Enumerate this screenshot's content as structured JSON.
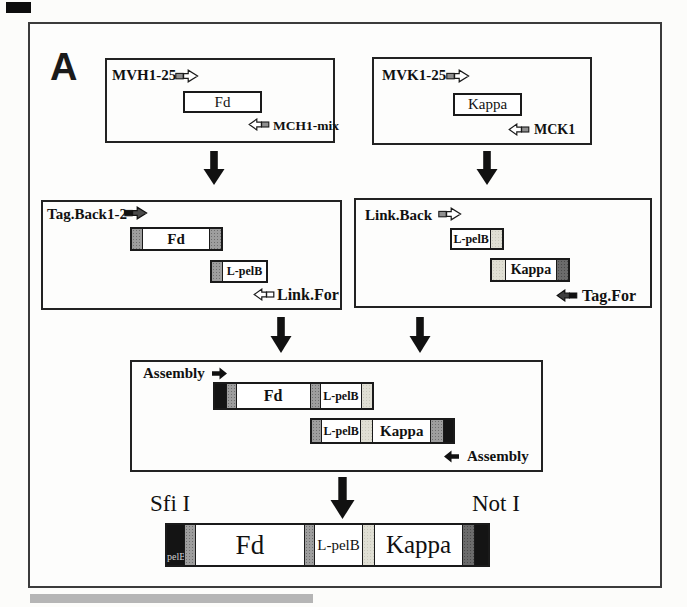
{
  "panel": {
    "label": "A"
  },
  "colors": {
    "cap_gray": "#9e9e9e",
    "cap_light": "#e0dfd4",
    "cap_dark": "#6b6b6b",
    "cap_black": "#141414",
    "arrow_black": "#111111",
    "frame_border": "#3b3b3b"
  },
  "step1_left": {
    "forward_primer": "MVH1-25",
    "gene": "Fd",
    "reverse_primer": "MCH1-mix"
  },
  "step1_right": {
    "forward_primer": "MVK1-25",
    "gene": "Kappa",
    "reverse_primer": "MCK1"
  },
  "step2_left": {
    "forward_primer": "Tag.Back1-2",
    "gene": "Fd",
    "linker": "L-pelB",
    "reverse_primer": "Link.For"
  },
  "step2_right": {
    "forward_primer": "Link.Back",
    "linker": "L-pelB",
    "gene": "Kappa",
    "reverse_primer": "Tag.For"
  },
  "step3": {
    "forward_primer": "Assembly",
    "reverse_primer": "Assembly",
    "fd_fragment": {
      "gene": "Fd",
      "linker": "L-pelB"
    },
    "kappa_fragment": {
      "linker": "L-pelB",
      "gene": "Kappa"
    }
  },
  "final_construct": {
    "left_site": "Sfi I",
    "right_site": "Not I",
    "leader": "pelB",
    "fd": "Fd",
    "linker": "L-pelB",
    "kappa": "Kappa"
  }
}
